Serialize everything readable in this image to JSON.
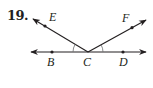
{
  "problem": {
    "number": "19."
  },
  "diagram": {
    "colors": {
      "line": "#231f20",
      "arc": "#6d6e70"
    },
    "points": [
      {
        "name": "B",
        "label": "B"
      },
      {
        "name": "C",
        "label": "C"
      },
      {
        "name": "D",
        "label": "D"
      },
      {
        "name": "E",
        "label": "E"
      },
      {
        "name": "F",
        "label": "F"
      }
    ],
    "lines": [
      "line BD"
    ],
    "rays": [
      "ray CE",
      "ray CF"
    ],
    "angle_marks": [
      "angle BCE",
      "angle DCF"
    ]
  }
}
